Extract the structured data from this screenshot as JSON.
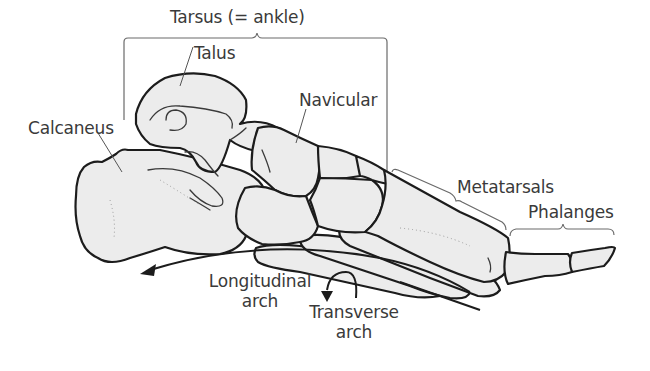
{
  "diagram": {
    "labels": {
      "tarsus": "Tarsus (= ankle)",
      "talus": "Talus",
      "calcaneus": "Calcaneus",
      "navicular": "Navicular",
      "metatarsals": "Metatarsals",
      "phalanges": "Phalanges",
      "longitudinal_arch_line1": "Longitudinal",
      "longitudinal_arch_line2": "arch",
      "transverse_arch_line1": "Transverse",
      "transverse_arch_line2": "arch"
    },
    "colors": {
      "bone_fill": "#ececec",
      "outline": "#1c1c1c",
      "label_text": "#3a3a3a",
      "bracket": "#6a6a6a",
      "background": "#ffffff"
    }
  }
}
